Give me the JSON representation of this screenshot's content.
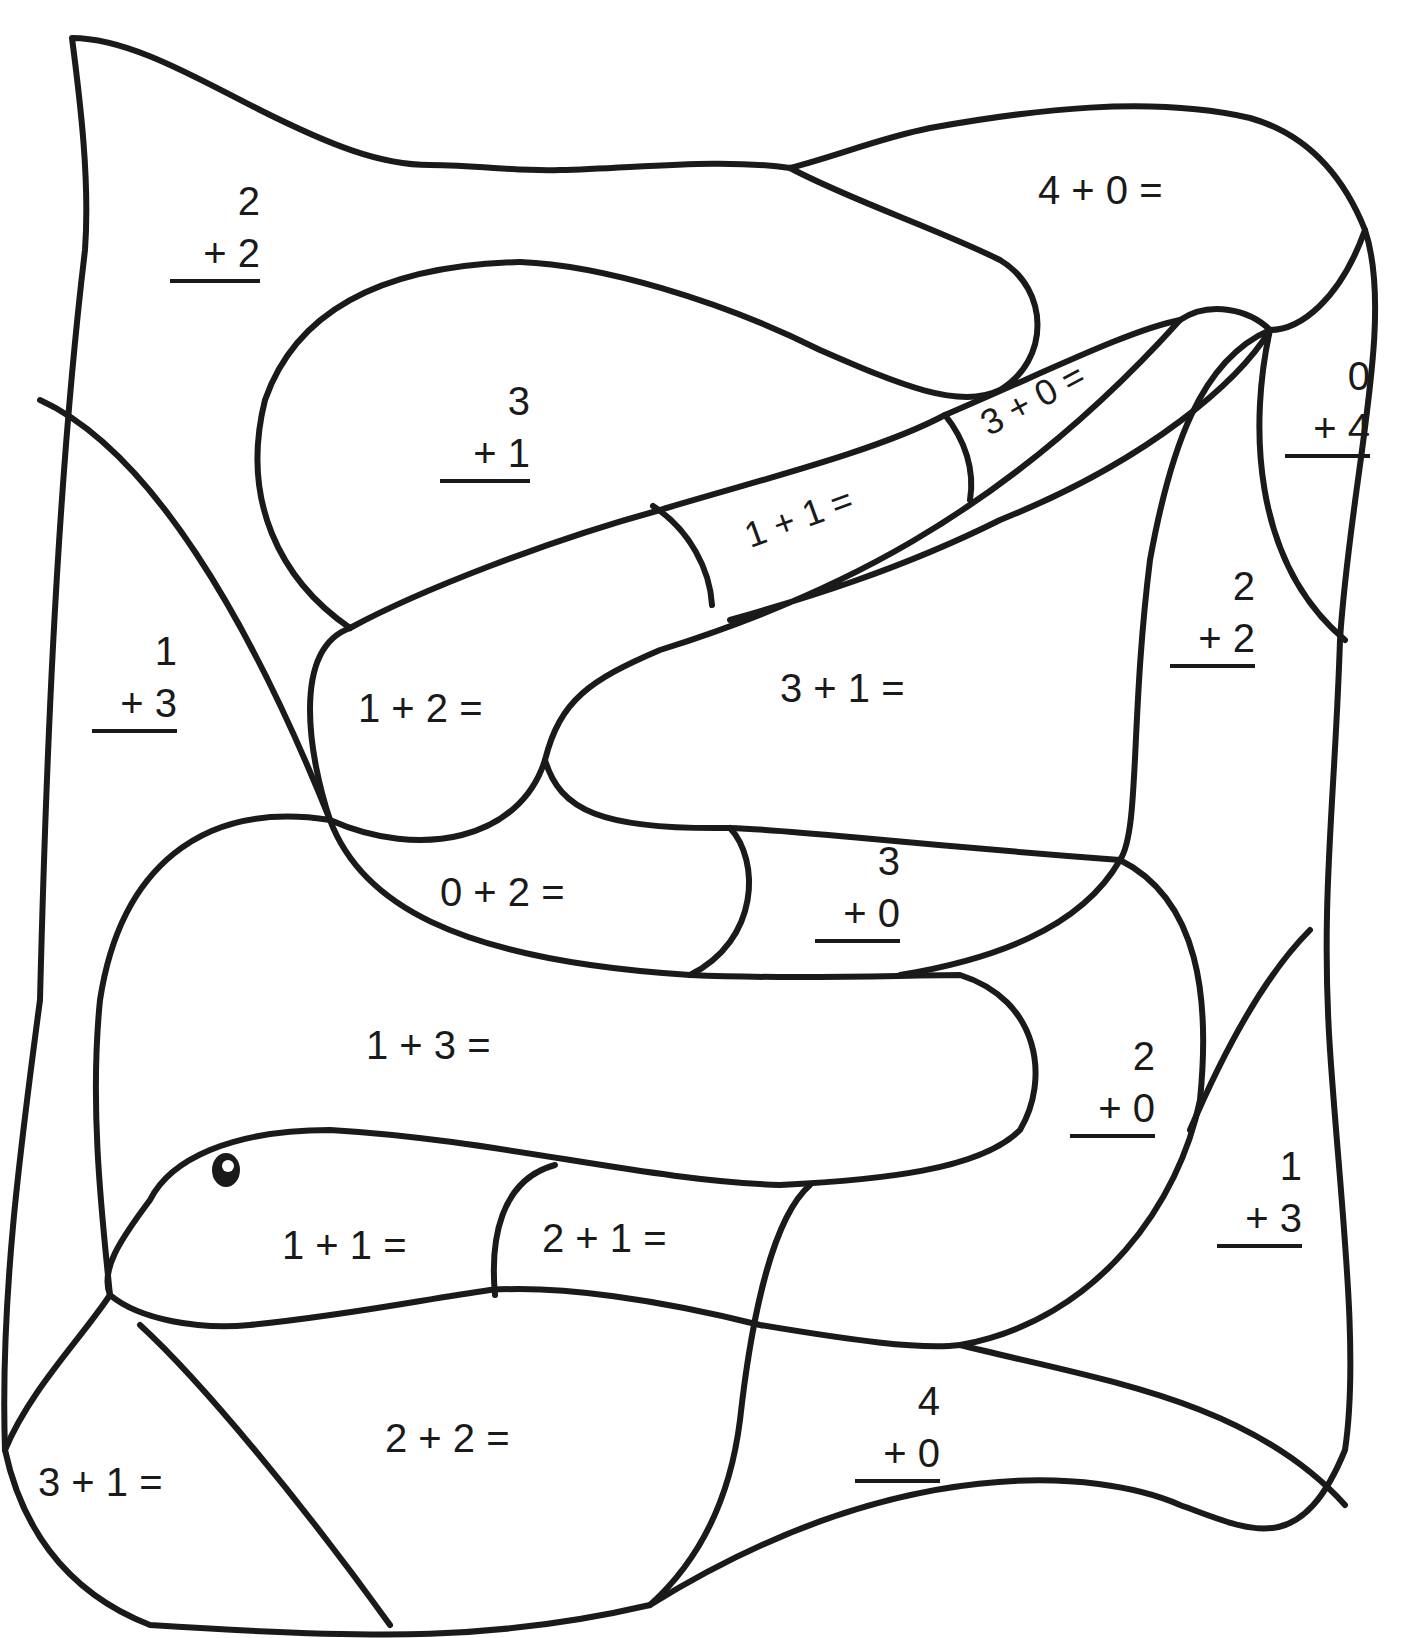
{
  "worksheet": {
    "type": "color-by-sum addition",
    "subject": "snake",
    "problems": [
      {
        "id": "p1",
        "layout": "vertical",
        "a": "2",
        "op": "+ 2"
      },
      {
        "id": "p2",
        "layout": "horizontal",
        "text": "4 + 0 ="
      },
      {
        "id": "p3",
        "layout": "vertical",
        "a": "3",
        "op": "+ 1"
      },
      {
        "id": "p4",
        "layout": "horizontal",
        "text": "3 + 0 ="
      },
      {
        "id": "p5",
        "layout": "vertical",
        "a": "0",
        "op": "+ 4"
      },
      {
        "id": "p6",
        "layout": "horizontal",
        "text": "1 + 1 ="
      },
      {
        "id": "p7",
        "layout": "vertical",
        "a": "1",
        "op": "+ 3"
      },
      {
        "id": "p8",
        "layout": "horizontal",
        "text": "1 + 2 ="
      },
      {
        "id": "p9",
        "layout": "horizontal",
        "text": "3 + 1 ="
      },
      {
        "id": "p10",
        "layout": "vertical",
        "a": "2",
        "op": "+ 2"
      },
      {
        "id": "p11",
        "layout": "horizontal",
        "text": "0 + 2 ="
      },
      {
        "id": "p12",
        "layout": "vertical",
        "a": "3",
        "op": "+ 0"
      },
      {
        "id": "p13",
        "layout": "horizontal",
        "text": "1 + 3 ="
      },
      {
        "id": "p14",
        "layout": "vertical",
        "a": "2",
        "op": "+ 0"
      },
      {
        "id": "p15",
        "layout": "vertical",
        "a": "1",
        "op": "+ 3"
      },
      {
        "id": "p16",
        "layout": "horizontal",
        "text": "1 + 1 ="
      },
      {
        "id": "p17",
        "layout": "horizontal",
        "text": "2 + 1 ="
      },
      {
        "id": "p18",
        "layout": "horizontal",
        "text": "2 + 2 ="
      },
      {
        "id": "p19",
        "layout": "vertical",
        "a": "4",
        "op": "+ 0"
      },
      {
        "id": "p20",
        "layout": "horizontal",
        "text": "3 + 1 ="
      }
    ]
  },
  "colors": {
    "ink": "#1a1a1a",
    "paper": "#ffffff"
  }
}
